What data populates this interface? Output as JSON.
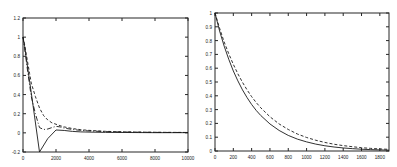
{
  "figure": {
    "background_color": "#ffffff",
    "line_color": "#1a1a1a",
    "axis_color": "#262626",
    "panel_count": 2
  },
  "chart_data": [
    {
      "type": "line",
      "panel": "left",
      "title": "",
      "xlabel": "",
      "ylabel": "",
      "xlim": [
        0,
        10000
      ],
      "ylim": [
        -0.2,
        1.2
      ],
      "xticks": [
        0,
        2000,
        4000,
        6000,
        8000,
        10000
      ],
      "xticklabels": [
        "0",
        "2000",
        "4000",
        "6000",
        "8000",
        "10000"
      ],
      "yticks": [
        -0.2,
        0,
        0.2,
        0.4,
        0.6,
        0.8,
        1,
        1.2
      ],
      "yticklabels": [
        "-0.2",
        "0",
        "0.2",
        "0.4",
        "0.6",
        "0.8",
        "1",
        "1.2"
      ],
      "grid": false,
      "legend": "none",
      "series": [
        {
          "name": "solid",
          "style": "solid",
          "x": [
            0,
            100,
            200,
            300,
            400,
            500,
            1000,
            1500,
            2000,
            2500,
            3000,
            3500,
            4000,
            5000,
            6000,
            7000,
            8000,
            9000,
            10000
          ],
          "y": [
            1.0,
            0.9,
            0.78,
            0.66,
            0.54,
            0.42,
            -0.2,
            -0.06,
            0.03,
            0.025,
            0.015,
            0.01,
            0.008,
            0.005,
            0.004,
            0.003,
            0.002,
            0.002,
            0.002
          ]
        },
        {
          "name": "dashed",
          "style": "dashed",
          "x": [
            0,
            100,
            200,
            300,
            400,
            500,
            750,
            1000,
            1250,
            1500,
            1750,
            2000,
            2250,
            2500,
            3000,
            3500,
            4000,
            5000,
            6000,
            7000,
            8000,
            9000,
            10000
          ],
          "y": [
            1.0,
            0.92,
            0.82,
            0.72,
            0.62,
            0.52,
            0.38,
            0.26,
            0.18,
            0.135,
            0.105,
            0.09,
            0.075,
            0.062,
            0.045,
            0.033,
            0.026,
            0.016,
            0.011,
            0.008,
            0.006,
            0.005,
            0.004
          ]
        },
        {
          "name": "dash-dot",
          "style": "dashdot",
          "x": [
            0,
            100,
            200,
            300,
            400,
            500,
            750,
            1000,
            1250,
            1500,
            1750,
            2000,
            2250,
            2500,
            3000,
            3500,
            4000,
            5000,
            6000,
            7000,
            8000,
            9000,
            10000
          ],
          "y": [
            1.0,
            0.88,
            0.75,
            0.62,
            0.5,
            0.38,
            0.2,
            0.055,
            0.035,
            0.04,
            0.055,
            0.068,
            0.062,
            0.05,
            0.035,
            0.026,
            0.02,
            0.013,
            0.009,
            0.007,
            0.005,
            0.004,
            0.004
          ]
        }
      ]
    },
    {
      "type": "line",
      "panel": "right",
      "title": "",
      "xlabel": "",
      "ylabel": "",
      "xlim": [
        0,
        1900
      ],
      "ylim": [
        0,
        1
      ],
      "xticks": [
        0,
        200,
        400,
        600,
        800,
        1000,
        1200,
        1400,
        1600,
        1800
      ],
      "xticklabels": [
        "0",
        "200",
        "400",
        "600",
        "800",
        "1000",
        "1200",
        "1400",
        "1600",
        "1800"
      ],
      "yticks": [
        0,
        0.1,
        0.2,
        0.3,
        0.4,
        0.5,
        0.6,
        0.7,
        0.8,
        0.9,
        1
      ],
      "yticklabels": [
        "0",
        "0.1",
        "0.2",
        "0.3",
        "0.4",
        "0.5",
        "0.6",
        "0.7",
        "0.8",
        "0.9",
        "1"
      ],
      "grid": false,
      "legend": "none",
      "series": [
        {
          "name": "solid",
          "style": "solid",
          "x": [
            0,
            50,
            100,
            150,
            200,
            250,
            300,
            350,
            400,
            450,
            500,
            600,
            700,
            800,
            900,
            1000,
            1100,
            1200,
            1300,
            1400,
            1500,
            1600,
            1700,
            1800,
            1900
          ],
          "y": [
            1.0,
            0.87,
            0.76,
            0.665,
            0.58,
            0.508,
            0.443,
            0.387,
            0.337,
            0.294,
            0.257,
            0.196,
            0.149,
            0.113,
            0.086,
            0.066,
            0.05,
            0.038,
            0.029,
            0.022,
            0.017,
            0.013,
            0.01,
            0.008,
            0.006
          ]
        },
        {
          "name": "dashed",
          "style": "dashed",
          "x": [
            0,
            50,
            100,
            150,
            200,
            250,
            300,
            350,
            400,
            450,
            500,
            600,
            700,
            800,
            900,
            1000,
            1100,
            1200,
            1300,
            1400,
            1500,
            1600,
            1700,
            1800,
            1900
          ],
          "y": [
            1.0,
            0.89,
            0.79,
            0.705,
            0.628,
            0.559,
            0.498,
            0.443,
            0.394,
            0.351,
            0.313,
            0.248,
            0.196,
            0.156,
            0.123,
            0.098,
            0.078,
            0.062,
            0.049,
            0.039,
            0.031,
            0.024,
            0.019,
            0.015,
            0.012
          ]
        }
      ]
    }
  ]
}
